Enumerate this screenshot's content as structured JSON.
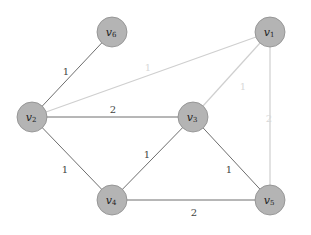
{
  "graph": {
    "nodes": [
      {
        "id": "v1",
        "base": "v",
        "sub": "1",
        "x": 270,
        "y": 32
      },
      {
        "id": "v2",
        "base": "v",
        "sub": "2",
        "x": 32,
        "y": 117
      },
      {
        "id": "v3",
        "base": "v",
        "sub": "3",
        "x": 193,
        "y": 117
      },
      {
        "id": "v4",
        "base": "v",
        "sub": "4",
        "x": 112,
        "y": 200
      },
      {
        "id": "v5",
        "base": "v",
        "sub": "5",
        "x": 270,
        "y": 200
      },
      {
        "id": "v6",
        "base": "v",
        "sub": "6",
        "x": 112,
        "y": 32
      }
    ],
    "edges": [
      {
        "from": "v6",
        "to": "v2",
        "weight": "1",
        "style": "dark",
        "lx": 66,
        "ly": 72
      },
      {
        "from": "v2",
        "to": "v1",
        "weight": "1",
        "style": "light",
        "lx": 148,
        "ly": 68
      },
      {
        "from": "v2",
        "to": "v3",
        "weight": "2",
        "style": "dark",
        "lx": 113,
        "ly": 110
      },
      {
        "from": "v3",
        "to": "v1",
        "weight": "1",
        "style": "light",
        "lx": 243,
        "ly": 87
      },
      {
        "from": "v1",
        "to": "v5",
        "weight": "2",
        "style": "light",
        "lx": 269,
        "ly": 119
      },
      {
        "from": "v2",
        "to": "v4",
        "weight": "1",
        "style": "dark",
        "lx": 65,
        "ly": 170
      },
      {
        "from": "v4",
        "to": "v3",
        "weight": "1",
        "style": "dark",
        "lx": 147,
        "ly": 155
      },
      {
        "from": "v3",
        "to": "v5",
        "weight": "1",
        "style": "dark",
        "lx": 229,
        "ly": 170
      },
      {
        "from": "v4",
        "to": "v5",
        "weight": "2",
        "style": "dark",
        "lx": 194,
        "ly": 213
      }
    ],
    "node_radius": 15,
    "colors": {
      "node_fill": "#b4b4b4",
      "node_stroke": "#8a8a8a",
      "edge_dark": "#6e6e6e",
      "edge_light": "#cfcfcf",
      "label_light": "#d8d8d8"
    }
  }
}
